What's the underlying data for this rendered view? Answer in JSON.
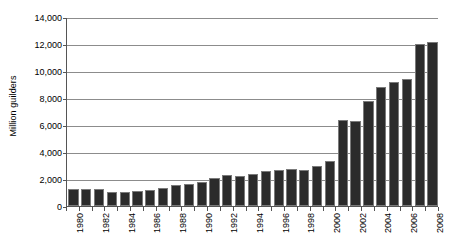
{
  "chart_data": {
    "type": "bar",
    "title": "",
    "subtitle": "",
    "xlabel": "",
    "ylabel": "Million guilders",
    "ylim": [
      0,
      14000
    ],
    "ytick_values": [
      0,
      2000,
      4000,
      6000,
      8000,
      10000,
      12000,
      14000
    ],
    "ytick_labels": [
      "0",
      "2,000",
      "4,000",
      "6,000",
      "8,000",
      "10,000",
      "12,000",
      "14,000"
    ],
    "grid": true,
    "grid_axis": "y",
    "legend": false,
    "legend_position": "none",
    "bar_color": "#2b2b2b",
    "bar_edge_color": "#7a7a7a",
    "axis_color": "#555555",
    "gridline_color": "#8c8c8c",
    "background_color": "#ffffff",
    "xtick_label_rotation": -90,
    "xtick_label_interval": 2,
    "categories": [
      "1980",
      "1981",
      "1982",
      "1983",
      "1984",
      "1985",
      "1986",
      "1987",
      "1988",
      "1989",
      "1990",
      "1991",
      "1992",
      "1993",
      "1994",
      "1995",
      "1996",
      "1997",
      "1998",
      "1999",
      "2000",
      "2001",
      "2002",
      "2003",
      "2004",
      "2005",
      "2006",
      "2007",
      "2008"
    ],
    "xtick_labels_shown": [
      "1980",
      "1982",
      "1984",
      "1986",
      "1988",
      "1990",
      "1992",
      "1994",
      "1996",
      "1998",
      "2000",
      "2002",
      "2004",
      "2006",
      "2008"
    ],
    "values": [
      1230,
      1250,
      1260,
      1060,
      1070,
      1110,
      1170,
      1370,
      1530,
      1650,
      1790,
      2050,
      2330,
      2200,
      2400,
      2580,
      2650,
      2750,
      2700,
      2960,
      3300,
      6400,
      6300,
      7750,
      8800,
      9200,
      9400,
      12000,
      12150
    ]
  }
}
